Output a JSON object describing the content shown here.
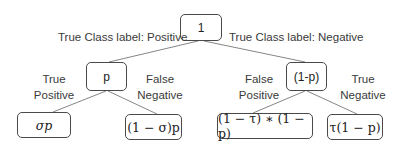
{
  "diagram": {
    "root": {
      "label": "1"
    },
    "branches": {
      "left_edge_label": "True Class label: Positive",
      "right_edge_label": "True Class label: Negative"
    },
    "mid_nodes": [
      {
        "label": "p"
      },
      {
        "label": "(1-p)"
      }
    ],
    "edge_labels": [
      {
        "line1": "True",
        "line2": "Positive"
      },
      {
        "line1": "False",
        "line2": "Negative"
      },
      {
        "line1": "False",
        "line2": "Positive"
      },
      {
        "line1": "True",
        "line2": "Negative"
      }
    ],
    "leaf_nodes": [
      {
        "label": "σp"
      },
      {
        "label": "(1 − σ)p"
      },
      {
        "label": "(1 − τ) ∗ (1 − p)"
      },
      {
        "label": "τ(1 − p)"
      }
    ],
    "colors": {
      "stroke": "#4a4a4a",
      "text": "#333333",
      "background": "#ffffff"
    }
  }
}
